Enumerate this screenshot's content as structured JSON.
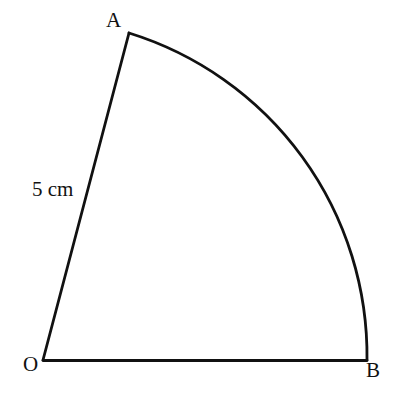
{
  "figure": {
    "name": "circle-sector-OAB",
    "background_color": "#ffffff",
    "stroke_color": "#111111",
    "stroke_width": 2.6,
    "labels": {
      "vertex_a": "A",
      "vertex_b": "B",
      "vertex_o": "O",
      "radius": "5 cm"
    },
    "geometry": {
      "type": "sector",
      "center": {
        "x": 43,
        "y": 360
      },
      "radius": 330,
      "point_a": {
        "x": 129,
        "y": 33
      },
      "point_b": {
        "x": 367,
        "y": 360
      },
      "start_angle_deg": 0,
      "end_angle_deg": 75.4,
      "path": "M 43 360 L 129 33 A 338 338 0 0 1 367 360 Z"
    }
  }
}
